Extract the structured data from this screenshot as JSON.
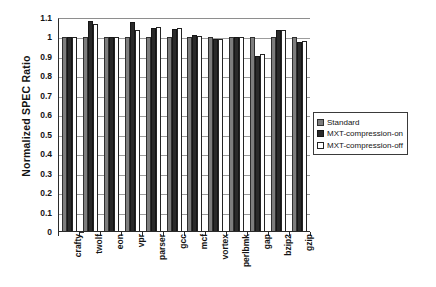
{
  "chart_data": {
    "type": "bar",
    "title": "",
    "xlabel": "",
    "ylabel": "Normalized SPEC Ratio",
    "ylim": [
      0,
      1.1
    ],
    "ytick_labels": [
      "1.1",
      "1",
      "0.9",
      "0.8",
      "0.7",
      "0.6",
      "0.5",
      "0.4",
      "0.3",
      "0.2",
      "0.1",
      "0"
    ],
    "ytick_values": [
      1.1,
      1.0,
      0.9,
      0.8,
      0.7,
      0.6,
      0.5,
      0.4,
      0.3,
      0.2,
      0.1,
      0.0
    ],
    "grid": true,
    "legend_position": "right",
    "categories": [
      "crafty",
      "twolf",
      "eon",
      "vpr",
      "parser",
      "gcc",
      "mcf",
      "vortex",
      "perlbmk",
      "gap",
      "bzip2",
      "gzip"
    ],
    "series": [
      {
        "name": "Standard",
        "color": "#7d7d7d",
        "values": [
          1.0,
          1.0,
          1.0,
          1.0,
          1.0,
          1.0,
          1.0,
          1.0,
          1.0,
          1.0,
          1.0,
          1.0
        ]
      },
      {
        "name": "MXT-compression-on",
        "color": "#2a2a2a",
        "values": [
          1.0,
          1.085,
          1.0,
          1.078,
          1.05,
          1.043,
          1.012,
          0.99,
          1.0,
          0.905,
          1.04,
          0.975
        ]
      },
      {
        "name": "MXT-compression-off",
        "color": "#ffffff",
        "values": [
          1.0,
          1.07,
          1.0,
          1.04,
          1.055,
          1.048,
          1.008,
          0.99,
          1.0,
          0.915,
          1.04,
          0.982
        ]
      }
    ]
  },
  "legend": {
    "items": [
      {
        "label": "Standard",
        "swatch": "s-standard"
      },
      {
        "label": "MXT-compression-on",
        "swatch": "s-on"
      },
      {
        "label": "MXT-compression-off",
        "swatch": "s-off"
      }
    ]
  }
}
